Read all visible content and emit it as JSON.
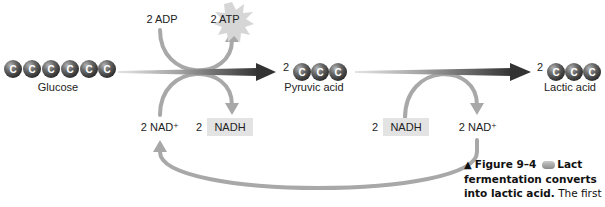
{
  "figure": {
    "colors": {
      "carbon_ball": "#5a5a5a",
      "carbon_ball_highlight": "#9a9a9a",
      "loop_arrow": "#a8a8a8",
      "main_arrow_dark": "#3a3a3a",
      "main_arrow_light": "#d8d8d8",
      "nadh_box": "#e3e3e3",
      "text": "#222222"
    }
  },
  "molecules": {
    "glucose": {
      "label": "Glucose",
      "carbons": [
        "C",
        "C",
        "C",
        "C",
        "C",
        "C"
      ]
    },
    "pyruvic_acid": {
      "coefficient": "2",
      "label": "Pyruvic acid",
      "carbons": [
        "C",
        "C",
        "C"
      ]
    },
    "lactic_acid": {
      "coefficient": "2",
      "label": "Lactic acid",
      "carbons": [
        "C",
        "C",
        "C"
      ]
    }
  },
  "glycolysis": {
    "adp_label": "2 ADP",
    "atp_label": "2 ATP",
    "nad_in_label": "2 NAD⁺",
    "nadh_coefficient": "2",
    "nadh_label": "NADH"
  },
  "fermentation": {
    "nadh_coefficient": "2",
    "nadh_label": "NADH",
    "nad_out_label": "2 NAD⁺"
  },
  "caption": {
    "marker": "▲",
    "figure_number": "Figure 9–4",
    "line1_tail": "Lact",
    "line2": "fermentation converts",
    "line3_bold": "into lactic acid.",
    "line3_tail": " The first"
  }
}
